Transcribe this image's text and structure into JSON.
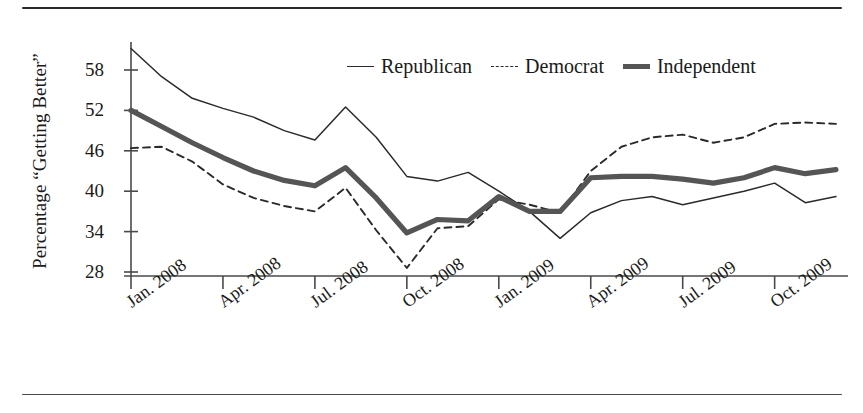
{
  "chart_data": {
    "type": "line",
    "title": "",
    "xlabel": "",
    "ylabel": "Percentage “Getting Better”",
    "ylim": [
      28,
      62
    ],
    "yticks": [
      28,
      34,
      40,
      46,
      52,
      58
    ],
    "grid": false,
    "legend_position": "top-center",
    "x": [
      "Jan. 2008",
      "Feb. 2008",
      "Mar. 2008",
      "Apr. 2008",
      "May 2008",
      "Jun. 2008",
      "Jul. 2008",
      "Aug. 2008",
      "Sep. 2008",
      "Oct. 2008",
      "Nov. 2008",
      "Dec. 2008",
      "Jan. 2009",
      "Feb. 2009",
      "Mar. 2009",
      "Apr. 2009",
      "May 2009",
      "Jun. 2009",
      "Jul. 2009",
      "Aug. 2009",
      "Sep. 2009",
      "Oct. 2009",
      "Nov. 2009",
      "Dec. 2009"
    ],
    "xtick_labels": [
      "Jan. 2008",
      "Apr. 2008",
      "Jul. 2008",
      "Oct. 2008",
      "Jan. 2009",
      "Apr. 2009",
      "Jul. 2009",
      "Oct. 2009"
    ],
    "xtick_indices": [
      0,
      3,
      6,
      9,
      12,
      15,
      18,
      21
    ],
    "series": [
      {
        "name": "Republican",
        "style": "thin-solid",
        "color": "#2a2a2a",
        "values": [
          61.2,
          57.0,
          53.8,
          52.3,
          51.0,
          49.0,
          47.6,
          52.5,
          48.0,
          42.2,
          41.5,
          42.8,
          40.0,
          37.0,
          33.0,
          36.8,
          38.6,
          39.2,
          38.0,
          39.0,
          40.0,
          41.2,
          38.3,
          39.2
        ]
      },
      {
        "name": "Democrat",
        "style": "dashed",
        "color": "#2a2a2a",
        "values": [
          46.4,
          46.6,
          44.4,
          41.0,
          39.0,
          37.8,
          37.0,
          40.5,
          34.2,
          28.6,
          34.5,
          34.8,
          38.8,
          38.0,
          36.8,
          43.0,
          46.6,
          48.0,
          48.4,
          47.2,
          48.0,
          50.0,
          50.2,
          50.0
        ]
      },
      {
        "name": "Independent",
        "style": "thick-solid",
        "color": "#555555",
        "values": [
          52.0,
          49.6,
          47.2,
          45.0,
          43.0,
          41.6,
          40.8,
          43.5,
          39.0,
          33.8,
          35.8,
          35.6,
          39.2,
          37.0,
          37.0,
          42.0,
          42.2,
          42.2,
          41.8,
          41.2,
          42.0,
          43.5,
          42.6,
          43.2
        ]
      }
    ]
  },
  "legend": {
    "entries": [
      {
        "label": "Republican",
        "swatch": "thin-line-swatch"
      },
      {
        "label": "Democrat",
        "swatch": "dashed-line-swatch"
      },
      {
        "label": "Independent",
        "swatch": "thick-line-swatch"
      }
    ]
  },
  "axes": {
    "y_axis_title": "Percentage “Getting Better”"
  }
}
